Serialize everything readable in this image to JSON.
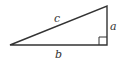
{
  "diagram": {
    "type": "right-triangle",
    "labels": {
      "hypotenuse": "c",
      "vertical_leg": "a",
      "horizontal_leg": "b"
    },
    "right_angle_marker": true,
    "colors": {
      "stroke": "#333333",
      "background": "#ffffff"
    }
  }
}
